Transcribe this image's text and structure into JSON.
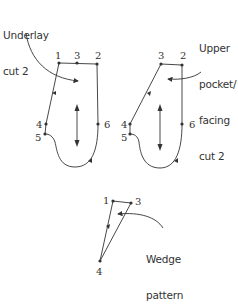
{
  "colors": {
    "line": "#333333",
    "background": "#ffffff"
  },
  "pieces": [
    {
      "name": "underlay",
      "label_lines": [
        "Underlay",
        "cut 2"
      ],
      "points": [
        {
          "id": "1",
          "x": 59,
          "y": 63
        },
        {
          "id": "3",
          "x": 77,
          "y": 63
        },
        {
          "id": "2",
          "x": 97,
          "y": 64
        },
        {
          "id": "4",
          "x": 46,
          "y": 124
        },
        {
          "id": "5",
          "x": 45,
          "y": 134
        },
        {
          "id": "6",
          "x": 98,
          "y": 124
        }
      ]
    },
    {
      "name": "upper-pocket-facing",
      "label_lines": [
        "Upper",
        "pocket/",
        "facing",
        "cut 2"
      ],
      "points": [
        {
          "id": "3",
          "x": 161,
          "y": 64
        },
        {
          "id": "2",
          "x": 182,
          "y": 65
        },
        {
          "id": "4",
          "x": 130,
          "y": 124
        },
        {
          "id": "5",
          "x": 130,
          "y": 134
        },
        {
          "id": "6",
          "x": 182,
          "y": 124
        }
      ]
    },
    {
      "name": "wedge",
      "label_lines": [
        "Wedge",
        "pattern"
      ],
      "points": [
        {
          "id": "1",
          "x": 113,
          "y": 201
        },
        {
          "id": "3",
          "x": 131,
          "y": 203
        },
        {
          "id": "4",
          "x": 100,
          "y": 261
        }
      ]
    }
  ],
  "labels": {
    "underlay_1": "Underlay",
    "underlay_2": "cut 2",
    "upper_1": "Upper",
    "upper_2": "pocket/",
    "upper_3": "facing",
    "upper_4": "cut 2",
    "wedge_1": "Wedge",
    "wedge_2": "pattern"
  },
  "point_labels": {
    "l1": "1",
    "l3": "3",
    "l2": "2",
    "l4": "4",
    "l5": "5",
    "l6": "6",
    "r3": "3",
    "r2": "2",
    "r4": "4",
    "r5": "5",
    "r6": "6",
    "w1": "1",
    "w3": "3",
    "w4": "4"
  }
}
